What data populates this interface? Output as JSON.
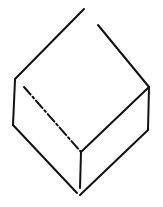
{
  "diagram": {
    "type": "line-drawing",
    "stroke_color": "#111111",
    "background": "#ffffff",
    "vertices": {
      "top": [
        84,
        9
      ],
      "left_top": [
        15,
        79
      ],
      "left_bottom": [
        13,
        125
      ],
      "bottom": [
        79,
        195
      ],
      "right_top": [
        149,
        87
      ],
      "right_bottom": [
        148,
        130
      ],
      "center": [
        81,
        152
      ]
    }
  }
}
